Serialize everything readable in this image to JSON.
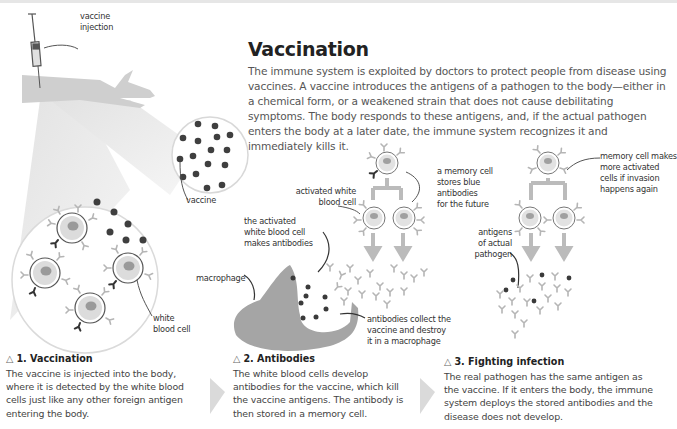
{
  "title": "Vaccination",
  "intro": "The immune system is exploited by doctors to protect people from disease using vaccines. A vaccine introduces the antigens of a pathogen to the body—either in a chemical form, or a weakened strain that does not cause debilitating symptoms. The body responds to these antigens, and, if the actual pathogen enters the body at a later date, the immune system recognizes it and immediately kills it.",
  "labels": {
    "vaccine_injection": [
      "vaccine",
      "injection"
    ],
    "vaccine": "vaccine",
    "white_blood_cell": [
      "white",
      "blood cell"
    ],
    "activated_white_blood_cell": [
      "activated white",
      "blood cell"
    ],
    "memory_cell_stores": [
      "a memory cell",
      "stores blue",
      "antibodies",
      "for the future"
    ],
    "activated_makes_antibodies": [
      "the activated",
      "white blood cell",
      "makes antibodies"
    ],
    "macrophage": "macrophage",
    "antibodies_collect": [
      "antibodies collect the",
      "vaccine and destroy",
      "it in a macrophage"
    ],
    "memory_cell_makes": [
      "memory cell makes",
      "more activated",
      "cells if invasion",
      "happens again"
    ],
    "antigens_actual_pathogen": [
      "antigens",
      "of actual",
      "pathogen"
    ]
  },
  "steps": [
    {
      "icon": "△",
      "title": "1. Vaccination",
      "text": "The vaccine is injected into the body, where it is detected by the white blood cells just like any other foreign antigen entering the body."
    },
    {
      "icon": "△",
      "title": "2. Antibodies",
      "text": "The white blood cells develop antibodies for the vaccine, which kill the vaccine antigens. The antibody is then stored in a memory cell."
    },
    {
      "icon": "△",
      "title": "3. Fighting infection",
      "text": "The real pathogen has the same antigen as the vaccine. If it enters the body, the immune system deploys the stored antibodies and the disease does not develop."
    }
  ],
  "colors": {
    "dark_dot": "#3a3a3a",
    "cell_fill": "#dcdcdc",
    "nucleus": "#9a9a9a",
    "arm": "#c8c8c8",
    "macrophage": "#a5a5a5",
    "arrow": "#b8b8b8"
  }
}
